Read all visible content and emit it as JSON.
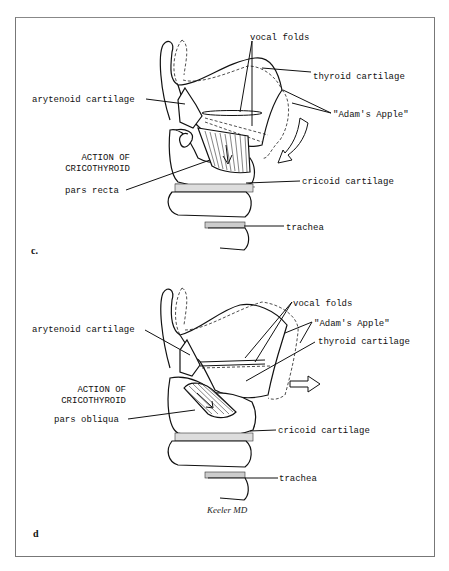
{
  "figure": {
    "panels": [
      {
        "id": "c",
        "panel_label": "c.",
        "labels": {
          "vocal_folds": "vocal folds",
          "thyroid_cartilage": "thyroid cartilage",
          "arytenoid_cartilage": "arytenoid cartilage",
          "adams_apple": "\"Adam's Apple\"",
          "action_line1": "ACTION OF",
          "action_line2": "CRICOTHYROID",
          "muscle_part": "pars recta",
          "cricoid_cartilage": "cricoid cartilage",
          "trachea": "trachea"
        },
        "motion_arrow": "curved-down-arrow-icon"
      },
      {
        "id": "d",
        "panel_label": "d",
        "labels": {
          "vocal_folds": "vocal folds",
          "adams_apple": "\"Adam's Apple\"",
          "arytenoid_cartilage": "arytenoid cartilage",
          "thyroid_cartilage": "thyroid cartilage",
          "action_line1": "ACTION OF",
          "action_line2": "CRICOTHYROID",
          "muscle_part": "pars obliqua",
          "cricoid_cartilage": "cricoid cartilage",
          "trachea": "trachea"
        },
        "motion_arrow": "right-arrow-icon",
        "signature": "Keeler MD"
      }
    ]
  }
}
